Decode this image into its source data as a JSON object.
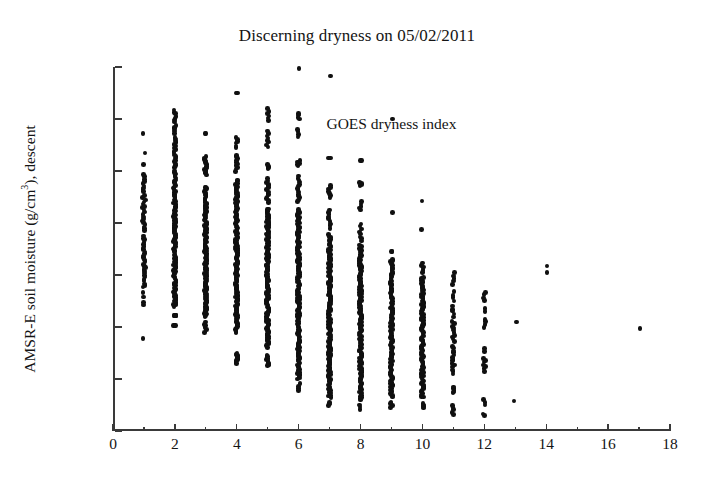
{
  "chart_data": {
    "type": "scatter",
    "title": "Discerning dryness on 05/02/2011",
    "xlabel": "GOES dryness index",
    "ylabel": "AMSR-E soil moisture (g/cm3), descent",
    "ylabel_prefix": "AMSR-E soil moisture (g/cm",
    "ylabel_exponent": "3",
    "ylabel_suffix": "), descent",
    "xlim": [
      0,
      18
    ],
    "ylim": [
      0.04,
      0.18
    ],
    "xticks": [
      0,
      2,
      4,
      6,
      8,
      10,
      12,
      14,
      16,
      18
    ],
    "xticklabels": [
      "0",
      "2",
      "4",
      "6",
      "8",
      "10",
      "12",
      "14",
      "16",
      "18"
    ],
    "xminorticks": [
      1,
      3,
      5,
      7,
      9,
      11,
      13,
      15,
      17
    ],
    "yticks": [
      0.04,
      0.06,
      0.08,
      0.1,
      0.12,
      0.14,
      0.16,
      0.18
    ],
    "yticklabels": [
      "0.04",
      "0.06",
      "0.08",
      "0.1",
      "0.12",
      "0.14",
      "0.16",
      "0.18"
    ],
    "grid": false,
    "legend": null,
    "marker_color": "#101010",
    "marker_size": 4.6,
    "axis_color": "#3a3a3a",
    "background": "#ffffff",
    "columns": [
      {
        "x": 1,
        "ymin": 0.0755,
        "ymax": 0.1545,
        "n": 62,
        "bands": [
          [
            0.1545,
            0.1545,
            1
          ],
          [
            0.147,
            0.147,
            1
          ],
          [
            0.1425,
            0.1425,
            1
          ],
          [
            0.132,
            0.1385,
            9
          ],
          [
            0.1235,
            0.1305,
            10
          ],
          [
            0.117,
            0.1225,
            8
          ],
          [
            0.1035,
            0.115,
            16
          ],
          [
            0.096,
            0.103,
            10
          ],
          [
            0.088,
            0.095,
            5
          ],
          [
            0.0755,
            0.0755,
            1
          ]
        ]
      },
      {
        "x": 2,
        "ymin": 0.0805,
        "ymax": 0.1635,
        "n": 150,
        "bands": [
          [
            0.1545,
            0.1635,
            12
          ],
          [
            0.1415,
            0.153,
            18
          ],
          [
            0.126,
            0.14,
            26
          ],
          [
            0.109,
            0.125,
            34
          ],
          [
            0.096,
            0.108,
            30
          ],
          [
            0.088,
            0.095,
            22
          ],
          [
            0.0845,
            0.0845,
            5
          ],
          [
            0.0805,
            0.0805,
            3
          ]
        ]
      },
      {
        "x": 3,
        "ymin": 0.078,
        "ymax": 0.1545,
        "n": 150,
        "bands": [
          [
            0.1545,
            0.1545,
            2
          ],
          [
            0.1385,
            0.1455,
            14
          ],
          [
            0.09,
            0.134,
            110
          ],
          [
            0.084,
            0.0895,
            18
          ],
          [
            0.078,
            0.082,
            6
          ]
        ]
      },
      {
        "x": 4,
        "ymin": 0.066,
        "ymax": 0.17,
        "n": 170,
        "bands": [
          [
            0.17,
            0.17,
            2
          ],
          [
            0.149,
            0.153,
            6
          ],
          [
            0.14,
            0.146,
            10
          ],
          [
            0.078,
            0.1365,
            140
          ],
          [
            0.066,
            0.07,
            12
          ]
        ]
      },
      {
        "x": 5,
        "ymin": 0.065,
        "ymax": 0.164,
        "n": 185,
        "bands": [
          [
            0.1595,
            0.164,
            6
          ],
          [
            0.149,
            0.1555,
            8
          ],
          [
            0.141,
            0.1425,
            5
          ],
          [
            0.128,
            0.137,
            14
          ],
          [
            0.072,
            0.1255,
            140
          ],
          [
            0.065,
            0.069,
            12
          ]
        ]
      },
      {
        "x": 6,
        "ymin": 0.0555,
        "ymax": 0.1795,
        "n": 190,
        "bands": [
          [
            0.1795,
            0.1795,
            1
          ],
          [
            0.16,
            0.162,
            4
          ],
          [
            0.153,
            0.156,
            4
          ],
          [
            0.142,
            0.144,
            5
          ],
          [
            0.128,
            0.138,
            14
          ],
          [
            0.06,
            0.125,
            158
          ],
          [
            0.0555,
            0.058,
            4
          ]
        ]
      },
      {
        "x": 7,
        "ymin": 0.05,
        "ymax": 0.1765,
        "n": 180,
        "bands": [
          [
            0.1765,
            0.1765,
            1
          ],
          [
            0.145,
            0.145,
            2
          ],
          [
            0.13,
            0.1345,
            7
          ],
          [
            0.118,
            0.125,
            9
          ],
          [
            0.053,
            0.1155,
            158
          ],
          [
            0.05,
            0.051,
            3
          ]
        ]
      },
      {
        "x": 8,
        "ymin": 0.0485,
        "ymax": 0.144,
        "n": 160,
        "bands": [
          [
            0.144,
            0.144,
            2
          ],
          [
            0.1345,
            0.1355,
            4
          ],
          [
            0.125,
            0.128,
            5
          ],
          [
            0.113,
            0.1195,
            8
          ],
          [
            0.052,
            0.1115,
            138
          ],
          [
            0.0485,
            0.05,
            3
          ]
        ]
      },
      {
        "x": 9,
        "ymin": 0.049,
        "ymax": 0.16,
        "n": 120,
        "bands": [
          [
            0.16,
            0.16,
            1
          ],
          [
            0.124,
            0.124,
            1
          ],
          [
            0.109,
            0.109,
            2
          ],
          [
            0.053,
            0.106,
            112
          ],
          [
            0.049,
            0.051,
            4
          ]
        ]
      },
      {
        "x": 10,
        "ymin": 0.049,
        "ymax": 0.1285,
        "n": 110,
        "bands": [
          [
            0.1285,
            0.1285,
            1
          ],
          [
            0.1175,
            0.1175,
            1
          ],
          [
            0.101,
            0.1045,
            6
          ],
          [
            0.053,
            0.099,
            98
          ],
          [
            0.049,
            0.0505,
            4
          ]
        ]
      },
      {
        "x": 11,
        "ymin": 0.0465,
        "ymax": 0.101,
        "n": 48,
        "bands": [
          [
            0.0965,
            0.101,
            5
          ],
          [
            0.09,
            0.0935,
            4
          ],
          [
            0.084,
            0.088,
            5
          ],
          [
            0.0745,
            0.082,
            10
          ],
          [
            0.062,
            0.0725,
            14
          ],
          [
            0.0545,
            0.057,
            5
          ],
          [
            0.0465,
            0.05,
            5
          ]
        ]
      },
      {
        "x": 12,
        "ymin": 0.046,
        "ymax": 0.0935,
        "n": 24,
        "bands": [
          [
            0.09,
            0.0935,
            4
          ],
          [
            0.086,
            0.087,
            2
          ],
          [
            0.08,
            0.083,
            4
          ],
          [
            0.0705,
            0.0715,
            2
          ],
          [
            0.063,
            0.068,
            7
          ],
          [
            0.05,
            0.052,
            3
          ],
          [
            0.046,
            0.0465,
            2
          ]
        ]
      },
      {
        "x": 13,
        "ymin": 0.0515,
        "ymax": 0.082,
        "n": 2,
        "bands": [
          [
            0.082,
            0.082,
            1
          ],
          [
            0.0515,
            0.0515,
            1
          ]
        ]
      },
      {
        "x": 14,
        "ymin": 0.101,
        "ymax": 0.1035,
        "n": 2,
        "bands": [
          [
            0.1035,
            0.1035,
            1
          ],
          [
            0.101,
            0.101,
            1
          ]
        ]
      },
      {
        "x": 17,
        "ymin": 0.0795,
        "ymax": 0.0795,
        "n": 1,
        "bands": [
          [
            0.0795,
            0.0795,
            1
          ]
        ]
      }
    ]
  }
}
